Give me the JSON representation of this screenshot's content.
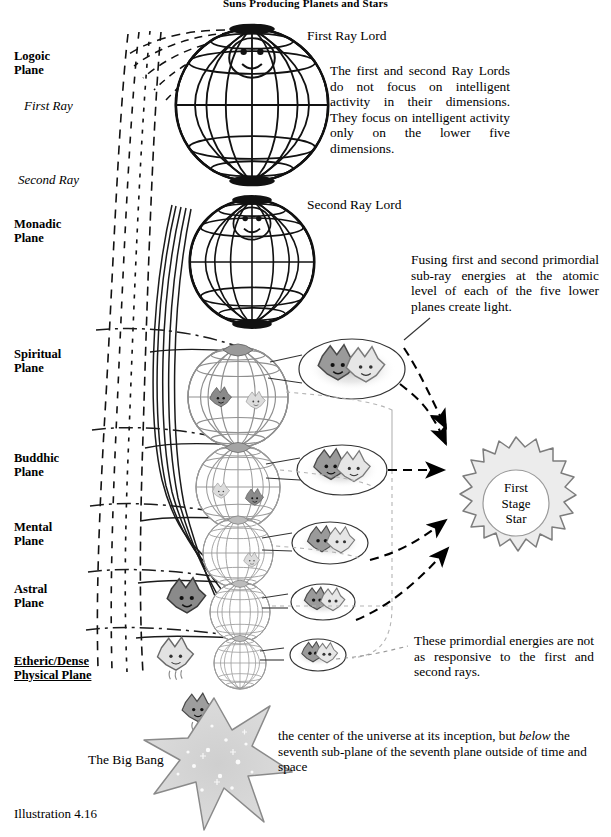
{
  "title": "Suns Producing Planets and Stars",
  "caption": "Illustration 4.16",
  "planes": [
    {
      "id": "logoic",
      "label": "Logoic\nPlane",
      "x": 14,
      "y": 50,
      "underline": false
    },
    {
      "id": "monadic",
      "label": "Monadic\nPlane",
      "x": 14,
      "y": 218,
      "underline": false
    },
    {
      "id": "spiritual",
      "label": "Spiritual\nPlane",
      "x": 14,
      "y": 348,
      "underline": false
    },
    {
      "id": "buddhic",
      "label": "Buddhic\nPlane",
      "x": 14,
      "y": 452,
      "underline": false
    },
    {
      "id": "mental",
      "label": "Mental\nPlane",
      "x": 14,
      "y": 521,
      "underline": false
    },
    {
      "id": "astral",
      "label": "Astral\nPlane",
      "x": 14,
      "y": 583,
      "underline": false
    },
    {
      "id": "etheric",
      "label": "Etheric/Dense\nPhysical Plane",
      "x": 14,
      "y": 655,
      "underline": true
    }
  ],
  "rays": [
    {
      "id": "first-ray",
      "label": "First Ray",
      "x": 24,
      "y": 98
    },
    {
      "id": "second-ray",
      "label": "Second Ray",
      "x": 18,
      "y": 172
    }
  ],
  "lords": [
    {
      "id": "first-ray-lord",
      "label": "First Ray Lord",
      "x": 307,
      "y": 28
    },
    {
      "id": "second-ray-lord",
      "label": "Second Ray Lord",
      "x": 307,
      "y": 197
    }
  ],
  "notes": {
    "lords_focus": "The first and second Ray Lords do not focus on intelligent activity in their dimensions. They focus on intelligent activity only on the lower five dimensions.",
    "fusing": "Fusing first and second primordial sub-ray energies at the atomic level of each of the five lower planes create light.",
    "responsive": "These primordial energies are not as responsive to the first and second rays."
  },
  "star": {
    "label_line1": "First",
    "label_line2": "Stage",
    "label_line3": "Star",
    "fill": "#eeeeee",
    "stroke": "#777777"
  },
  "bigbang": {
    "label": "The Big Bang",
    "text_pre": "the center of the universe at its inception, but ",
    "text_em": "below",
    "text_post": " the seventh sub-plane of the seventh plane outside of time and space",
    "fill": "#d8d8d8",
    "stroke": "#808080"
  },
  "colors": {
    "ink": "#000000",
    "grid_dark": "#1a1a1a",
    "grid_light": "#8a8a8a",
    "rim_shade": "#606060",
    "creature_dark": "#808080",
    "creature_light": "#d5d5d5",
    "dashed_gray": "#9a9a9a"
  },
  "globes": [
    {
      "id": "globe-logoic",
      "cx": 252,
      "cy": 105,
      "r": 76,
      "style": "large"
    },
    {
      "id": "globe-monadic",
      "cx": 252,
      "cy": 262,
      "r": 62,
      "style": "large"
    },
    {
      "id": "globe-spiritual",
      "cx": 238,
      "cy": 397,
      "r": 50,
      "style": "small"
    },
    {
      "id": "globe-buddhic",
      "cx": 238,
      "cy": 487,
      "r": 42,
      "style": "small"
    },
    {
      "id": "globe-mental",
      "cx": 238,
      "cy": 553,
      "r": 35,
      "style": "small"
    },
    {
      "id": "globe-astral",
      "cx": 240,
      "cy": 612,
      "r": 30,
      "style": "small"
    },
    {
      "id": "globe-etheric",
      "cx": 240,
      "cy": 663,
      "r": 26,
      "style": "small"
    }
  ],
  "callouts": [
    {
      "id": "callout-spiritual",
      "cx": 352,
      "cy": 369,
      "rx": 53,
      "ry": 30
    },
    {
      "id": "callout-buddhic",
      "cx": 342,
      "cy": 470,
      "rx": 45,
      "ry": 25
    },
    {
      "id": "callout-mental",
      "cx": 330,
      "cy": 543,
      "rx": 38,
      "ry": 21
    },
    {
      "id": "callout-astral",
      "cx": 323,
      "cy": 602,
      "rx": 32,
      "ry": 18
    },
    {
      "id": "callout-etheric",
      "cx": 318,
      "cy": 655,
      "rx": 28,
      "ry": 16
    }
  ]
}
